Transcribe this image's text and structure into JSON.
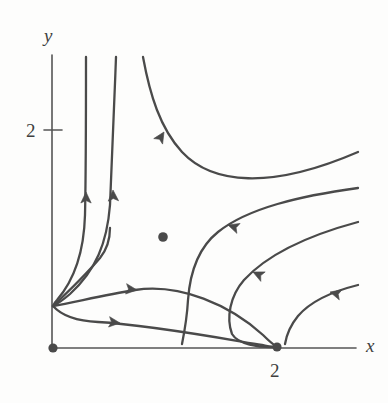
{
  "figure": {
    "kind": "phase-portrait",
    "background_color": "#fdfdfc",
    "stroke_color": "#4a4a4a",
    "axis_color": "#555555"
  },
  "axes": {
    "x_axis": {
      "label": "x",
      "label_x": 366,
      "label_y": 352,
      "line": {
        "x1": 52,
        "y1": 348,
        "x2": 356,
        "y2": 348
      }
    },
    "y_axis": {
      "label": "y",
      "label_x": 44,
      "label_y": 42,
      "line": {
        "x1": 52,
        "y1": 55,
        "x2": 52,
        "y2": 348
      }
    },
    "ticks": [
      {
        "name": "y-tick-2",
        "label": "2",
        "label_x": 26,
        "label_y": 137,
        "mark": {
          "x1": 44,
          "y1": 130,
          "x2": 62,
          "y2": 130
        }
      },
      {
        "name": "x-tick-2",
        "label": "2",
        "label_x": 270,
        "label_y": 377,
        "mark": null
      }
    ]
  },
  "equilibria": [
    {
      "name": "origin-equilibrium",
      "x": 53,
      "y": 348,
      "r": 4.6,
      "kind": "filled-node"
    },
    {
      "name": "x2-equilibrium",
      "x": 277,
      "y": 347,
      "r": 4.6,
      "kind": "filled-node"
    },
    {
      "name": "interior-equilibrium",
      "x": 163,
      "y": 237,
      "r": 4.8,
      "kind": "filled-dot"
    }
  ],
  "trajectories": [
    {
      "name": "trajectory-left-vertical",
      "path": "M 86,57 C 86,110 86,170 85,215 C 84,250 76,278 57,300 C 55,302 54,304 53,306",
      "arrows": [
        {
          "x": 86,
          "y": 192,
          "angle": -90
        }
      ]
    },
    {
      "name": "trajectory-mid-vertical",
      "path": "M 116,57 C 114,110 112,165 110,205 C 107,243 96,270 70,294 C 63,300 57,304 53,306",
      "arrows": [
        {
          "x": 113,
          "y": 190,
          "angle": -92
        }
      ]
    },
    {
      "name": "trajectory-rising-right",
      "path": "M 143,57 C 150,95 160,128 182,152 C 212,184 270,190 358,152",
      "arrows": [
        {
          "x": 164,
          "y": 132,
          "angle": -58
        }
      ]
    },
    {
      "name": "trajectory-inflow-upper",
      "path": "M 358,188 C 300,196 248,208 218,232 C 198,248 190,272 188,300 C 187,318 184,334 182,344",
      "arrows": [
        {
          "x": 228,
          "y": 225,
          "angle": 198
        }
      ]
    },
    {
      "name": "trajectory-inflow-mid",
      "path": "M 358,222 C 306,236 266,256 244,280 C 230,296 226,318 232,334 C 238,344 258,348 277,347",
      "arrows": [
        {
          "x": 253,
          "y": 272,
          "angle": 205
        }
      ]
    },
    {
      "name": "trajectory-inflow-lower",
      "path": "M 358,285 C 330,292 310,302 298,316 C 289,327 286,338 285,344",
      "arrows": [
        {
          "x": 330,
          "y": 292,
          "angle": 195
        }
      ]
    },
    {
      "name": "trajectory-saddle-upper-branch",
      "path": "M 53,306 C 75,302 105,295 135,290 C 180,283 230,305 263,335 C 269,341 274,345 277,347",
      "arrows": [
        {
          "x": 137,
          "y": 290,
          "angle": 6
        }
      ]
    },
    {
      "name": "trajectory-saddle-lower-branch",
      "path": "M 53,306 C 62,316 76,321 98,322 C 150,325 220,338 262,345 C 268,346 273,347 277,347",
      "arrows": [
        {
          "x": 120,
          "y": 323,
          "angle": 6
        }
      ]
    },
    {
      "name": "trajectory-fan-upper",
      "path": "M 53,306 C 70,290 88,272 100,258 C 108,248 110,238 110,228",
      "arrows": []
    }
  ]
}
